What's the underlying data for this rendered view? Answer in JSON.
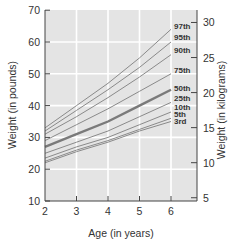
{
  "chart_data": {
    "type": "line",
    "title": "",
    "xlabel": "Age (in years)",
    "ylabel": "Weight (in pounds)",
    "ylabel_right": "Weight (in kilograms)",
    "xlim": [
      2,
      7
    ],
    "ylim": [
      10,
      70
    ],
    "ylim_right_kg": [
      5,
      31
    ],
    "x_ticks": [
      2,
      3,
      4,
      5,
      6
    ],
    "y_ticks": [
      10,
      20,
      30,
      40,
      50,
      60,
      70
    ],
    "y_ticks_right": [
      5,
      10,
      15,
      20,
      25,
      30
    ],
    "grid": true,
    "legend_position": "inline-right",
    "x": [
      2,
      3,
      4,
      5,
      6
    ],
    "series": [
      {
        "name": "97th",
        "values": [
          33,
          40,
          47,
          55,
          64
        ],
        "bold": false
      },
      {
        "name": "95th",
        "values": [
          32,
          38.5,
          45,
          52,
          60
        ],
        "bold": false
      },
      {
        "name": "90th",
        "values": [
          31,
          36.5,
          42.5,
          49,
          56
        ],
        "bold": false
      },
      {
        "name": "75th",
        "values": [
          29,
          34,
          39,
          44.5,
          50
        ],
        "bold": false
      },
      {
        "name": "50th",
        "values": [
          27,
          31,
          35,
          40,
          45
        ],
        "bold": true
      },
      {
        "name": "25th",
        "values": [
          25,
          28.5,
          32,
          36.5,
          41
        ],
        "bold": false
      },
      {
        "name": "10th",
        "values": [
          23.5,
          27,
          30,
          34,
          38
        ],
        "bold": false
      },
      {
        "name": "5th",
        "values": [
          22.5,
          26,
          29,
          32.5,
          36
        ],
        "bold": false
      },
      {
        "name": "3rd",
        "values": [
          22,
          25.5,
          28.5,
          32,
          35
        ],
        "bold": false
      }
    ]
  },
  "colors": {
    "plot_bg": "#e4e4e4",
    "grid": "#ffffff",
    "line": "#8a8a8a",
    "line_bold": "#7a7a7a",
    "axis": "#444444",
    "text": "#333333"
  },
  "labels": {
    "x_title": "Age (in years)",
    "y_title": "Weight (in pounds)",
    "y_right_title": "Weight (in kilograms)"
  }
}
